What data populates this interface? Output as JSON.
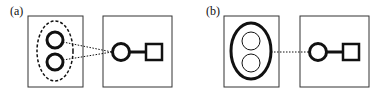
{
  "panels": [
    {
      "label": "(a)",
      "label_pos": [
        10,
        5
      ],
      "left_box": {
        "x": 28,
        "y": 16,
        "w": 55,
        "h": 71
      },
      "right_box": {
        "x": 103,
        "y": 16,
        "w": 69,
        "h": 71
      },
      "group_outline": {
        "cx": 55,
        "cy": 51,
        "rx": 18,
        "ry": 30,
        "style": "dashed",
        "stroke_width": 1.5
      },
      "inner_circles": [
        {
          "cx": 55,
          "cy": 40,
          "r": 8,
          "stroke_width": 3
        },
        {
          "cx": 55,
          "cy": 62,
          "r": 8,
          "stroke_width": 3
        }
      ],
      "connectors": [
        {
          "x1": 63,
          "y1": 42,
          "x2": 112,
          "y2": 52
        },
        {
          "x1": 63,
          "y1": 60,
          "x2": 112,
          "y2": 52
        }
      ],
      "node_circle": {
        "cx": 121,
        "cy": 52,
        "r": 8.5,
        "stroke_width": 3
      },
      "link": {
        "x1": 130,
        "y1": 52,
        "x2": 146,
        "y2": 52
      },
      "node_square": {
        "x": 146,
        "y": 44,
        "w": 16,
        "h": 16,
        "stroke_width": 2.5
      }
    },
    {
      "label": "(b)",
      "label_pos": [
        206,
        5
      ],
      "left_box": {
        "x": 224,
        "y": 16,
        "w": 55,
        "h": 71
      },
      "right_box": {
        "x": 300,
        "y": 16,
        "w": 69,
        "h": 71
      },
      "group_outline": {
        "cx": 251,
        "cy": 51,
        "rx": 20,
        "ry": 28,
        "style": "solid",
        "stroke_width": 3
      },
      "inner_circles": [
        {
          "cx": 251,
          "cy": 41,
          "r": 9,
          "stroke_width": 1
        },
        {
          "cx": 251,
          "cy": 63,
          "r": 9,
          "stroke_width": 1
        }
      ],
      "connectors": [
        {
          "x1": 271,
          "y1": 52,
          "x2": 310,
          "y2": 52
        }
      ],
      "node_circle": {
        "cx": 318,
        "cy": 52,
        "r": 8.5,
        "stroke_width": 3
      },
      "link": {
        "x1": 327,
        "y1": 52,
        "x2": 343,
        "y2": 52
      },
      "node_square": {
        "x": 343,
        "y": 44,
        "w": 16,
        "h": 16,
        "stroke_width": 2.5
      }
    }
  ],
  "colors": {
    "stroke": "#111111",
    "box_stroke": "#333333",
    "background": "#ffffff"
  }
}
